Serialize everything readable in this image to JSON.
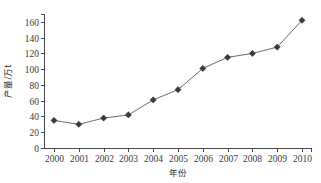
{
  "chart_data": {
    "type": "line",
    "title": "",
    "xlabel": "年份",
    "ylabel": "产量/万t",
    "categories": [
      "2000",
      "2001",
      "2002",
      "2003",
      "2004",
      "2005",
      "2006",
      "2007",
      "2008",
      "2009",
      "2010"
    ],
    "x": [
      2000,
      2001,
      2002,
      2003,
      2004,
      2005,
      2006,
      2007,
      2008,
      2009,
      2010
    ],
    "values": [
      35,
      30,
      38,
      42,
      61,
      74,
      101,
      115,
      120,
      128,
      162
    ],
    "series": [
      {
        "name": "产量",
        "values": [
          35,
          30,
          38,
          42,
          61,
          74,
          101,
          115,
          120,
          128,
          162
        ]
      }
    ],
    "ylim": [
      0,
      170
    ],
    "xlim": [
      2000,
      2010
    ],
    "yticks": [
      0,
      20,
      40,
      60,
      80,
      100,
      120,
      140,
      160
    ],
    "ytick_labels": [
      "0",
      "20",
      "40",
      "60",
      "80",
      "100",
      "120",
      "140",
      "160"
    ],
    "xtick_labels": [
      "2000",
      "2001",
      "2002",
      "2003",
      "2004",
      "2005",
      "2006",
      "2007",
      "2008",
      "2009",
      "2010"
    ],
    "grid": false,
    "legend": false,
    "legend_position": "none",
    "marker": "diamond",
    "line_color": "#6b6b6b",
    "marker_color": "#3b3b3b",
    "axis_color": "#4a4a4a",
    "background_color": "#ffffff"
  }
}
